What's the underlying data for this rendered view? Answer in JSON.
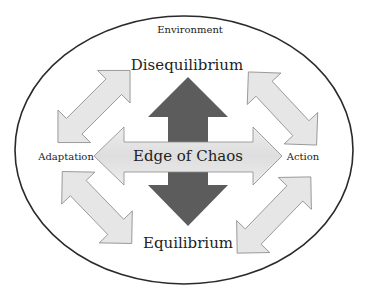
{
  "diagram": {
    "container_label": "Environment",
    "top_label": "Disequilibrium",
    "bottom_label": "Equilibrium",
    "center_label": "Edge of Chaos",
    "left_label": "Adaptation",
    "right_label": "Action"
  },
  "colors": {
    "ellipse_stroke": "#2a2a2a",
    "light_arrow_fill": "#e6e6e6",
    "light_arrow_stroke": "#8a8a8a",
    "dark_arrow_fill": "#5c5c5c"
  }
}
